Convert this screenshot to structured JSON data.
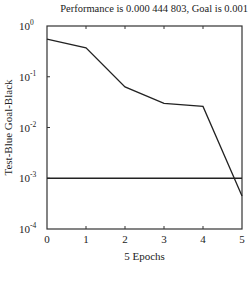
{
  "chart_data": {
    "type": "line",
    "title": "Performance is 0.000 444 803,  Goal is 0.001",
    "xlabel": "5 Epochs",
    "ylabel": "Test-Blue Goal-Black",
    "yscale": "log",
    "xlim": [
      0,
      5
    ],
    "ylim": [
      0.0001,
      1
    ],
    "x_ticks": [
      "0",
      "1",
      "2",
      "3",
      "4",
      "5"
    ],
    "y_ticks": [
      {
        "base": "10",
        "exp": "0"
      },
      {
        "base": "10",
        "exp": "-1"
      },
      {
        "base": "10",
        "exp": "-2"
      },
      {
        "base": "10",
        "exp": "-3"
      },
      {
        "base": "10",
        "exp": "-4"
      }
    ],
    "grid": false,
    "series": [
      {
        "name": "Test",
        "color": "#222222",
        "x": [
          0,
          1,
          2,
          3,
          4,
          5
        ],
        "values": [
          0.55,
          0.37,
          0.063,
          0.03,
          0.026,
          0.000444803
        ]
      },
      {
        "name": "Goal",
        "color": "#222222",
        "x": [
          0,
          5
        ],
        "values": [
          0.001,
          0.001
        ]
      }
    ]
  }
}
